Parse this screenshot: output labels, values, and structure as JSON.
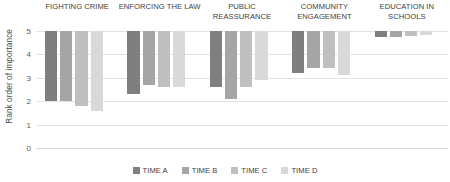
{
  "chart_data": {
    "type": "bar",
    "title": "",
    "subtitle": "",
    "xlabel": "",
    "ylabel": "Rank order of importance",
    "ylim": [
      0,
      5
    ],
    "yticks": [
      0,
      1,
      2,
      3,
      4,
      5
    ],
    "ytick_labels": [
      "0",
      "1",
      "2",
      "3",
      "4",
      "5"
    ],
    "grid": true,
    "legend_position": "bottom",
    "bar_style": "floating-range-from-top",
    "range_top": 5,
    "note": "Each bar is drawn from the value 5 down to the listed value, representing the span of the rank-order band.",
    "categories": [
      "FIGHTING CRIME",
      "ENFORCING THE LAW",
      "PUBLIC REASSURANCE",
      "COMMUNITY ENGAGEMENT",
      "EDUCATION IN SCHOOLS"
    ],
    "series": [
      {
        "name": "TIME A",
        "color": "#7f7f7f",
        "values": [
          2.0,
          2.3,
          2.6,
          3.2,
          4.75
        ]
      },
      {
        "name": "TIME B",
        "color": "#a5a5a5",
        "values": [
          2.0,
          2.7,
          2.1,
          3.4,
          4.75
        ]
      },
      {
        "name": "TIME C",
        "color": "#bfbfbf",
        "values": [
          1.8,
          2.6,
          2.6,
          3.4,
          4.8
        ]
      },
      {
        "name": "TIME D",
        "color": "#d9d9d9",
        "values": [
          1.6,
          2.6,
          2.9,
          3.1,
          4.85
        ]
      }
    ]
  }
}
